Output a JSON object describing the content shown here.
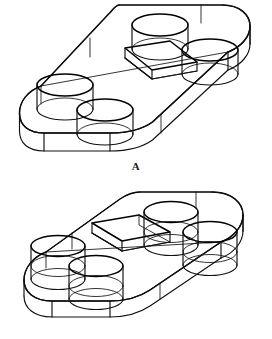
{
  "document": {
    "title": "Isometric wireframe views of a rounded rectangular plate",
    "background_color": "#ffffff",
    "line_color": "#111111",
    "view_count": 2
  },
  "figures": [
    {
      "id": "A",
      "label": "A",
      "description": "Isometric wireframe view of a rounded-rectangular plate with four cylindrical through holes and a raised rectangular boss near the center; viewed from above-left.",
      "part": {
        "outline_shape": "rounded rectangle (obround corners)",
        "corner_radius_style": "full radius ends",
        "thickness_visible": true,
        "hole_count": 4,
        "hole_type": "cylindrical through hole",
        "central_feature": "raised rectangular boss",
        "central_feature_count": 1,
        "projection": "isometric",
        "line_style": "visible edges only (wireframe, hidden lines shown)"
      }
    },
    {
      "id": "B",
      "label": "B",
      "description": "Isometric wireframe view of the same rounded-rectangular plate with four cylindrical through holes and a recessed rectangular pocket near the center; viewed from above-left with holes drawn through the full thickness.",
      "part": {
        "outline_shape": "rounded rectangle (obround corners)",
        "corner_radius_style": "full radius ends",
        "thickness_visible": true,
        "hole_count": 4,
        "hole_type": "cylindrical through hole",
        "central_feature": "recessed rectangular pocket",
        "central_feature_count": 1,
        "projection": "isometric",
        "line_style": "visible edges only (wireframe, hidden lines shown)"
      }
    }
  ],
  "captions": {
    "figure_a": "A",
    "figure_b": "B"
  }
}
